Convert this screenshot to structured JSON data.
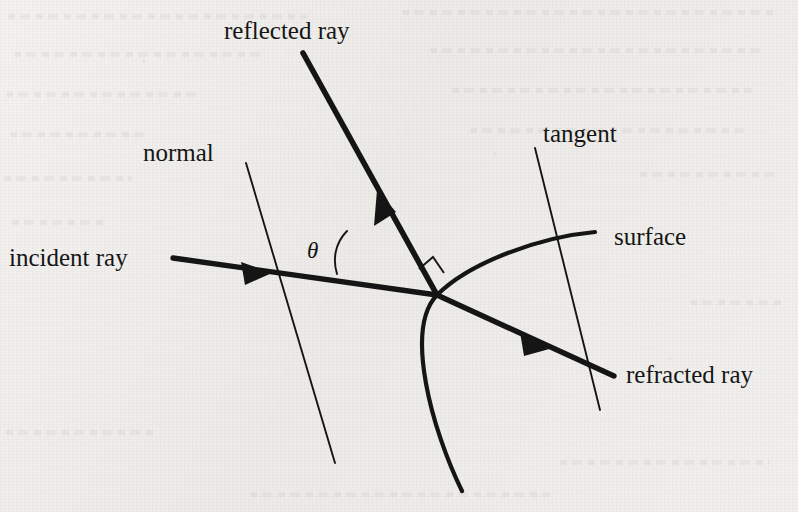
{
  "figure": {
    "background_color": "#efeeec",
    "ink_color": "#151515",
    "labels": {
      "reflected_ray": "reflected ray",
      "normal": "normal",
      "tangent": "tangent",
      "surface": "surface",
      "incident_ray": "incident ray",
      "refracted_ray": "refracted ray",
      "theta": "θ"
    },
    "geometry": {
      "intersection_point": [
        437,
        295
      ],
      "incident_ray": {
        "from": [
          173,
          258
        ],
        "to": [
          437,
          295
        ],
        "arrow_at": [
          268,
          272
        ],
        "style": "thick-arrow"
      },
      "reflected_ray": {
        "from": [
          437,
          295
        ],
        "to": [
          303,
          53
        ],
        "arrow_at": [
          381,
          196
        ],
        "style": "thick-arrow"
      },
      "refracted_ray": {
        "from": [
          437,
          295
        ],
        "to": [
          614,
          376
        ],
        "arrow_at": [
          549,
          346
        ],
        "style": "thick-arrow"
      },
      "normal_line": {
        "from": [
          246,
          163
        ],
        "to": [
          335,
          463
        ],
        "style": "thin"
      },
      "tangent_line": {
        "from": [
          535,
          148
        ],
        "to": [
          600,
          410
        ],
        "style": "thin"
      },
      "surface_arc": {
        "from": [
          595,
          232
        ],
        "through": [
          437,
          295
        ],
        "to": [
          462,
          491
        ],
        "style": "medium-curve"
      },
      "right_angle_marker": {
        "corner": [
          432,
          258
        ],
        "size": 16
      },
      "theta_arc": {
        "vertex": [
          437,
          295
        ],
        "from_ray": "normal",
        "to_ray": "incident_ray"
      }
    }
  }
}
